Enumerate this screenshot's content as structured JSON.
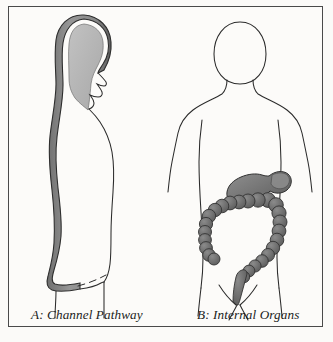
{
  "figure": {
    "background_color": "#fbfaf8",
    "frame_color": "#4a4a4a",
    "ink_color": "#2b2b2b"
  },
  "panels": [
    {
      "id": "panel-a",
      "letter": "A",
      "caption": "A: Channel Pathway",
      "view": "lateral profile, facing right",
      "elements": [
        {
          "name": "body-outline",
          "description": "side profile outline of head, face, neck, torso and legs",
          "stroke": "#2b2b2b"
        },
        {
          "name": "channel-pathway",
          "description": "broad shaded band running over the crown of the head, down the nape and along the full length of the back to the buttock",
          "fill": "#8d8d8d",
          "outline": "#2f2f2f"
        },
        {
          "name": "head-channel-interior",
          "description": "lighter shaded region enclosed by the channel over the skull",
          "fill": "#b6b6b6"
        },
        {
          "name": "hip-dashed-line",
          "description": "dashed line marking the hip / buttock crease",
          "stroke": "#2b2b2b"
        }
      ]
    },
    {
      "id": "panel-b",
      "letter": "B",
      "caption": "B: Internal Organs",
      "view": "anterior, front facing",
      "elements": [
        {
          "name": "body-outline",
          "description": "front facing outline of head, neck, shoulders, arms, torso and legs",
          "stroke": "#2b2b2b"
        },
        {
          "name": "stomach",
          "description": "shaded stomach with fundus and pylorus in the upper left abdomen",
          "fill": "#7a7a7a",
          "outline": "#2f2f2f"
        },
        {
          "name": "large-intestine",
          "description": "haustrated colon drawn as a chain of bulbous segments forming ascending, transverse, descending and sigmoid portions",
          "fill": "#6e6e6e",
          "outline": "#2f2f2f"
        },
        {
          "name": "rectum",
          "description": "terminal segment descending toward the perineum",
          "fill": "#6e6e6e"
        },
        {
          "name": "groin-line",
          "description": "V shaped groin crease with inner leg lines",
          "stroke": "#2b2b2b"
        }
      ]
    }
  ],
  "captions": {
    "a": "A: Channel Pathway",
    "b": "B: Internal Organs"
  },
  "colors": {
    "page_background": "#fbfaf8",
    "panel_background": "#fcfbf9",
    "frame": "#4a4a4a",
    "outline_ink": "#2b2b2b",
    "channel_fill": "#8d8d8d",
    "channel_light_fill": "#b6b6b6",
    "organ_fill": "#6e6e6e",
    "organ_outline": "#2f2f2f",
    "caption_text": "#1b1b1b"
  }
}
